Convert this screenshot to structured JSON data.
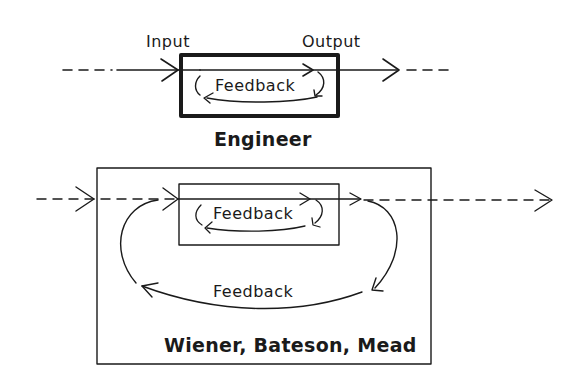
{
  "diagram": {
    "type": "feedback-loop-comparison",
    "colors": {
      "ink": "#1a1a1a",
      "background": "#ffffff"
    },
    "top": {
      "input_label": "Input",
      "output_label": "Output",
      "inner_loop_label": "Feedback",
      "caption": "Engineer"
    },
    "bottom": {
      "inner_loop_label": "Feedback",
      "outer_loop_label": "Feedback",
      "caption": "Wiener, Bateson, Mead"
    }
  }
}
